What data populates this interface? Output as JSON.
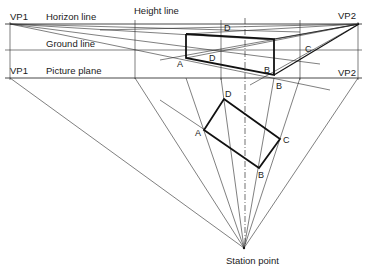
{
  "labels": {
    "vp1_top": "VP1",
    "horizon_line": "Horizon line",
    "height_line": "Height line",
    "vp2_top": "VP2",
    "ground_line": "Ground line",
    "vp1_bottom": "VP1",
    "picture_plane": "Picture plane",
    "vp2_bottom": "VP2",
    "station_point": "Station point"
  },
  "perspective_points": {
    "d_top": "D",
    "a_persp": "A",
    "d_persp": "D",
    "b_persp": "B",
    "c_persp": "C",
    "b_picture_plane": "B"
  },
  "plan_points": {
    "d": "D",
    "a": "A",
    "c": "C",
    "b": "B"
  }
}
